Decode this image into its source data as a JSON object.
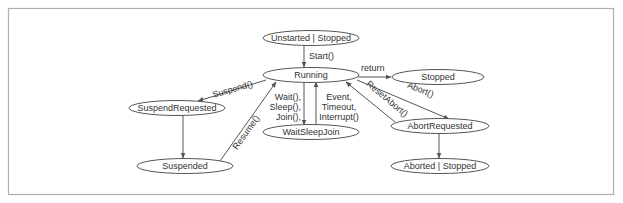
{
  "diagram": {
    "type": "state-machine",
    "states": {
      "unstarted": "Unstarted | Stopped",
      "running": "Running",
      "stopped": "Stopped",
      "suspend_requested": "SuspendRequested",
      "suspended": "Suspended",
      "wait_sleep_join": "WaitSleepJoin",
      "abort_requested": "AbortRequested",
      "aborted": "Aborted | Stopped"
    },
    "transitions": {
      "start": "Start()",
      "return": "return",
      "suspend": "Suspend()",
      "resume": "Resume()",
      "wait_line1": "Wait(),",
      "wait_line2": "Sleep(),",
      "wait_line3": "Join(),",
      "event_line1": "Event,",
      "event_line2": "Timeout,",
      "event_line3": "Interrupt()",
      "reset_abort": "ResetAbort()",
      "abort": "Abort()"
    },
    "edges": [
      {
        "from": "Unstarted | Stopped",
        "to": "Running",
        "label": "Start()"
      },
      {
        "from": "Running",
        "to": "Stopped",
        "label": "return"
      },
      {
        "from": "Running",
        "to": "SuspendRequested",
        "label": "Suspend()"
      },
      {
        "from": "SuspendRequested",
        "to": "Suspended",
        "label": ""
      },
      {
        "from": "Suspended",
        "to": "Running",
        "label": "Resume()"
      },
      {
        "from": "Running",
        "to": "WaitSleepJoin",
        "label": "Wait(), Sleep(), Join(),"
      },
      {
        "from": "WaitSleepJoin",
        "to": "Running",
        "label": "Event, Timeout, Interrupt()"
      },
      {
        "from": "Running",
        "to": "AbortRequested",
        "label": "Abort()"
      },
      {
        "from": "AbortRequested",
        "to": "Running",
        "label": "ResetAbort()"
      },
      {
        "from": "AbortRequested",
        "to": "Aborted | Stopped",
        "label": ""
      }
    ],
    "colors": {
      "stroke": "#555555",
      "text": "#333333",
      "frame": "#b0b0b0",
      "background": "#ffffff"
    }
  }
}
